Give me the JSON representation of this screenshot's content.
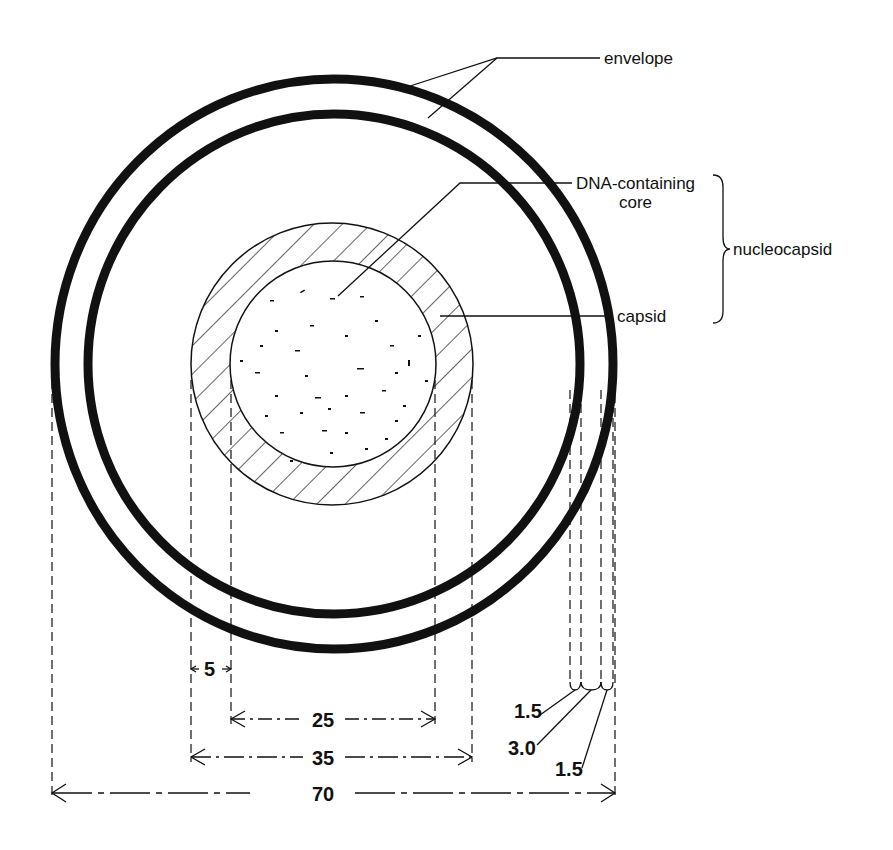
{
  "diagram": {
    "labels": {
      "envelope": "envelope",
      "core_line1": "DNA-containing",
      "core_line2": "core",
      "capsid": "capsid",
      "nucleocapsid": "nucleocapsid"
    },
    "dimensions": {
      "capsid_thickness": "5",
      "core_diameter": "25",
      "nucleocapsid_diameter": "35",
      "total_diameter": "70",
      "outer_membrane": "1.5",
      "intermembrane_space": "3.0",
      "inner_membrane": "1.5"
    },
    "colors": {
      "ink": "#111111",
      "background": "#ffffff"
    }
  }
}
